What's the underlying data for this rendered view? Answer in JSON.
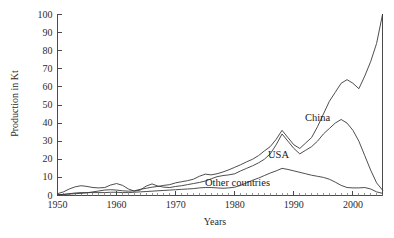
{
  "chart_data": {
    "type": "line",
    "title": "",
    "xlabel": "Years",
    "ylabel": "Production in Kt",
    "xlim": [
      1950,
      2005
    ],
    "ylim": [
      0,
      100
    ],
    "grid": false,
    "legend_position": "inline-annotations",
    "xticks": [
      1950,
      1960,
      1970,
      1980,
      1990,
      2000
    ],
    "xtick_labels": [
      "1950",
      "1960",
      "1970",
      "1980",
      "1990",
      "2000"
    ],
    "yticks": [
      0,
      10,
      20,
      30,
      40,
      50,
      60,
      70,
      80,
      90,
      100
    ],
    "ytick_labels": [
      "0",
      "10",
      "20",
      "30",
      "40",
      "50",
      "60",
      "70",
      "80",
      "90",
      "100"
    ],
    "minor_xtick_interval": 1,
    "x": [
      1950,
      1951,
      1952,
      1953,
      1954,
      1955,
      1956,
      1957,
      1958,
      1959,
      1960,
      1961,
      1962,
      1963,
      1964,
      1965,
      1966,
      1967,
      1968,
      1969,
      1970,
      1971,
      1972,
      1973,
      1974,
      1975,
      1976,
      1977,
      1978,
      1979,
      1980,
      1981,
      1982,
      1983,
      1984,
      1985,
      1986,
      1987,
      1988,
      1989,
      1990,
      1991,
      1992,
      1993,
      1994,
      1995,
      1996,
      1997,
      1998,
      1999,
      2000,
      2001,
      2002,
      2003,
      2004,
      2005
    ],
    "series": [
      {
        "name": "China",
        "label": "China",
        "color": "#3a3a3a",
        "values": [
          0.5,
          0.6,
          0.8,
          1.0,
          1.2,
          1.5,
          2.0,
          2.5,
          3.0,
          3.2,
          3.0,
          2.6,
          2.4,
          2.6,
          3.4,
          4.0,
          4.6,
          5.0,
          5.6,
          6.0,
          7.0,
          7.6,
          8.2,
          9.0,
          10.6,
          11.8,
          11.4,
          12.0,
          13.0,
          14.2,
          15.6,
          17.0,
          18.6,
          20.0,
          22.0,
          24.6,
          27.0,
          31.0,
          36.0,
          32.0,
          28.0,
          26.0,
          29.0,
          32.0,
          38.0,
          45.0,
          52.0,
          57.0,
          62.0,
          64.0,
          62.0,
          59.0,
          66.0,
          74.0,
          84.0,
          100.0
        ]
      },
      {
        "name": "USA",
        "label": "USA",
        "color": "#3a3a3a",
        "values": [
          1.0,
          2.0,
          3.6,
          4.8,
          5.4,
          5.0,
          4.4,
          4.2,
          4.4,
          5.8,
          6.6,
          5.6,
          3.6,
          2.4,
          3.0,
          5.2,
          6.4,
          5.2,
          4.6,
          4.4,
          5.0,
          5.4,
          6.0,
          6.6,
          7.2,
          8.0,
          9.2,
          10.4,
          11.0,
          11.4,
          12.0,
          13.6,
          15.0,
          16.4,
          18.0,
          20.0,
          23.0,
          28.0,
          34.0,
          30.0,
          26.0,
          23.0,
          25.0,
          27.0,
          30.0,
          34.0,
          37.0,
          40.0,
          42.0,
          40.0,
          36.0,
          30.0,
          22.0,
          14.0,
          7.0,
          3.0
        ]
      },
      {
        "name": "Other countries",
        "label": "Other countries",
        "color": "#3a3a3a",
        "values": [
          0.4,
          0.6,
          1.0,
          1.4,
          1.6,
          1.6,
          1.6,
          1.6,
          1.6,
          1.8,
          1.8,
          1.6,
          1.6,
          1.8,
          2.0,
          2.2,
          2.4,
          2.6,
          2.8,
          3.0,
          3.2,
          3.4,
          3.6,
          3.8,
          4.2,
          4.4,
          4.4,
          4.2,
          4.0,
          4.2,
          4.6,
          5.6,
          7.0,
          8.4,
          9.6,
          11.0,
          12.4,
          13.6,
          15.0,
          14.4,
          13.6,
          12.8,
          12.0,
          11.2,
          10.6,
          10.0,
          9.0,
          7.4,
          5.6,
          4.4,
          4.2,
          4.2,
          4.4,
          3.6,
          2.0,
          1.2
        ]
      }
    ]
  },
  "axes": {
    "y_title": "Production in Kt",
    "x_title": "Years"
  }
}
